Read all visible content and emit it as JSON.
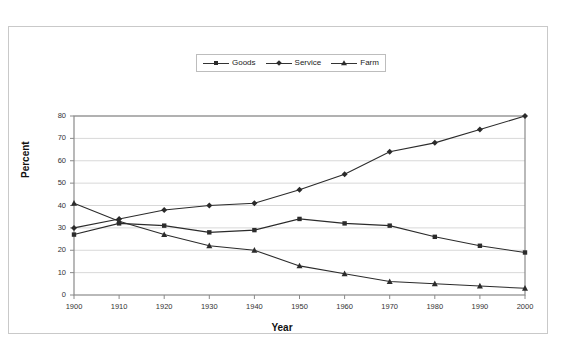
{
  "chart_data": {
    "type": "line",
    "title": "",
    "xlabel": "Year",
    "ylabel": "Percent",
    "x": [
      1900,
      1910,
      1920,
      1930,
      1940,
      1950,
      1960,
      1970,
      1980,
      1990,
      2000
    ],
    "xtick_labels": [
      "1900",
      "1910",
      "1920",
      "1930",
      "1940",
      "1950",
      "1960",
      "1970",
      "1980",
      "1990",
      "2000"
    ],
    "ytick_labels": [
      "0",
      "10",
      "20",
      "30",
      "40",
      "50",
      "60",
      "70",
      "80"
    ],
    "yticks": [
      0,
      10,
      20,
      30,
      40,
      50,
      60,
      70,
      80
    ],
    "ylim": [
      0,
      80
    ],
    "xlim": [
      1900,
      2000
    ],
    "grid": true,
    "legend_position": "top-center",
    "series": [
      {
        "name": "Goods",
        "marker": "square",
        "color": "#2b2b2b",
        "values": [
          27,
          32,
          31,
          28,
          29,
          34,
          32,
          31,
          26,
          22,
          19
        ]
      },
      {
        "name": "Service",
        "marker": "diamond",
        "color": "#2b2b2b",
        "values": [
          30,
          34,
          38,
          40,
          41,
          47,
          54,
          64,
          68,
          74,
          80
        ]
      },
      {
        "name": "Farm",
        "marker": "triangle",
        "color": "#2b2b2b",
        "values": [
          41,
          33,
          27,
          22,
          20,
          13,
          9.5,
          6,
          5,
          4,
          3
        ]
      }
    ]
  },
  "legend": {
    "items": [
      {
        "label": "Goods"
      },
      {
        "label": "Service"
      },
      {
        "label": "Farm"
      }
    ]
  },
  "axes": {
    "x_title": "Year",
    "y_title": "Percent"
  }
}
